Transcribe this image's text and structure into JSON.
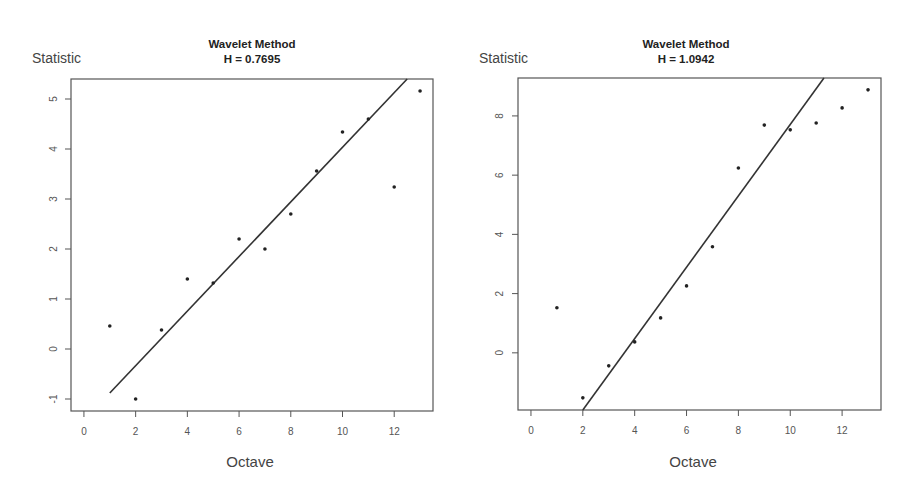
{
  "chart_data": [
    {
      "type": "scatter",
      "title": "Wavelet Method",
      "subtitle": "H = 0.7695",
      "xlabel": "Octave",
      "ylabel": "Statistic",
      "x": [
        1,
        2,
        3,
        4,
        5,
        6,
        7,
        8,
        9,
        10,
        11,
        12,
        13
      ],
      "series": [
        {
          "name": "Statistic",
          "values": [
            0.46,
            -1.0,
            0.38,
            1.4,
            1.32,
            2.2,
            2.0,
            2.7,
            3.56,
            4.34,
            4.6,
            3.24,
            5.16
          ]
        }
      ],
      "fit_line": {
        "x0": 1,
        "y0": -0.88,
        "x1": 12.5,
        "y1": 5.4
      },
      "xlim": [
        -0.5,
        13.5
      ],
      "ylim": [
        -1.24,
        5.4
      ],
      "xticks": [
        0,
        2,
        4,
        6,
        8,
        10,
        12
      ],
      "yticks": [
        -1,
        0,
        1,
        2,
        3,
        4,
        5
      ],
      "grid": false,
      "legend": null
    },
    {
      "type": "scatter",
      "title": "Wavelet Method",
      "subtitle": "H = 1.0942",
      "xlabel": "Octave",
      "ylabel": "Statistic",
      "x": [
        1,
        2,
        3,
        4,
        5,
        6,
        7,
        8,
        9,
        10,
        11,
        12,
        13
      ],
      "series": [
        {
          "name": "Statistic",
          "values": [
            1.52,
            -1.52,
            -0.44,
            0.37,
            1.18,
            2.26,
            3.58,
            6.24,
            7.69,
            7.53,
            7.76,
            8.27,
            8.88
          ]
        }
      ],
      "fit_line": {
        "x0": 2,
        "y0": -1.93,
        "x1": 11.3,
        "y1": 9.28
      },
      "xlim": [
        -0.5,
        13.5
      ],
      "ylim": [
        -1.93,
        9.28
      ],
      "xticks": [
        0,
        2,
        4,
        6,
        8,
        10,
        12
      ],
      "yticks": [
        0,
        2,
        4,
        6,
        8
      ],
      "grid": false,
      "legend": null
    }
  ],
  "panels": [
    {
      "ylabel": "Statistic",
      "title": "Wavelet Method",
      "subtitle": "H = 0.7695",
      "xlabel": "Octave"
    },
    {
      "ylabel": "Statistic",
      "title": "Wavelet Method",
      "subtitle": "H = 1.0942",
      "xlabel": "Octave"
    }
  ]
}
